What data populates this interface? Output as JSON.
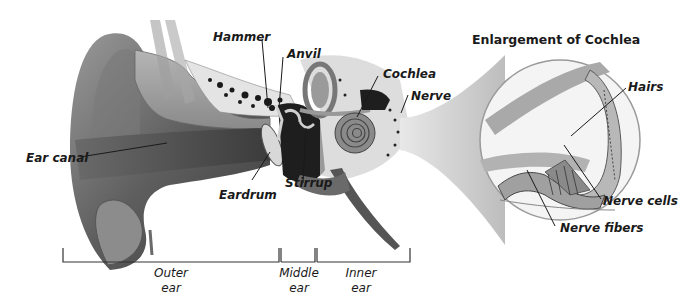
{
  "diagram": {
    "title": "Enlargement of Cochlea",
    "labels": {
      "hammer": "Hammer",
      "anvil": "Anvil",
      "cochlea": "Cochlea",
      "nerve": "Nerve",
      "ear_canal": "Ear canal",
      "eardrum": "Eardrum",
      "stirrup": "Stirrup",
      "hairs": "Hairs",
      "nerve_cells": "Nerve cells",
      "nerve_fibers": "Nerve fibers"
    },
    "sections": [
      {
        "line1": "Outer",
        "line2": "ear"
      },
      {
        "line1": "Middle",
        "line2": "ear"
      },
      {
        "line1": "Inner",
        "line2": "ear"
      }
    ]
  }
}
